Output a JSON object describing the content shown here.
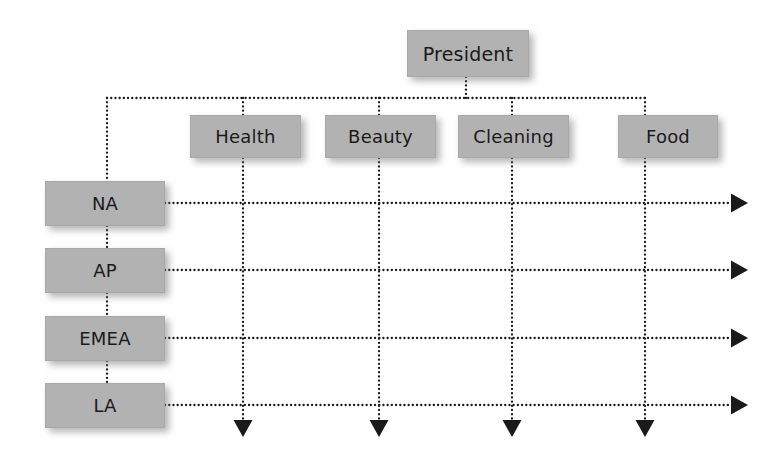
{
  "diagram": {
    "type": "matrix-organization-chart",
    "colors": {
      "node_fill": "#b2b2b2",
      "node_border": "#a8a8a8",
      "node_text": "#1a1a1a",
      "connector": "#1a1a1a",
      "background": "#ffffff"
    },
    "connector_style": "dotted"
  },
  "top": {
    "label": "President",
    "box": {
      "x": 407,
      "y": 30,
      "w": 122,
      "h": 47
    }
  },
  "functions": [
    {
      "label": "Health",
      "box": {
        "x": 190,
        "y": 115,
        "w": 111,
        "h": 43
      },
      "center_x": 243,
      "arrow": "down"
    },
    {
      "label": "Beauty",
      "box": {
        "x": 325,
        "y": 115,
        "w": 111,
        "h": 43
      },
      "center_x": 379,
      "arrow": "down"
    },
    {
      "label": "Cleaning",
      "box": {
        "x": 458,
        "y": 115,
        "w": 111,
        "h": 43
      },
      "center_x": 512,
      "arrow": "down"
    },
    {
      "label": "Food",
      "box": {
        "x": 618,
        "y": 115,
        "w": 100,
        "h": 43
      },
      "center_x": 645,
      "arrow": "down"
    }
  ],
  "regions": [
    {
      "label": "NA",
      "box": {
        "x": 45,
        "y": 181,
        "w": 120,
        "h": 45
      },
      "center_y": 203,
      "arrow": "right"
    },
    {
      "label": "AP",
      "box": {
        "x": 45,
        "y": 248,
        "w": 120,
        "h": 45
      },
      "center_y": 270,
      "arrow": "right"
    },
    {
      "label": "EMEA",
      "box": {
        "x": 45,
        "y": 316,
        "w": 120,
        "h": 45
      },
      "center_y": 338,
      "arrow": "right"
    },
    {
      "label": "LA",
      "box": {
        "x": 45,
        "y": 383,
        "w": 120,
        "h": 45
      },
      "center_y": 405,
      "arrow": "right"
    }
  ],
  "bus": {
    "y": 98,
    "left_x": 107,
    "right_x": 645,
    "president_drop_x": 466
  },
  "arrows": {
    "right_tip_x": 748,
    "down_tip_y": 437
  }
}
